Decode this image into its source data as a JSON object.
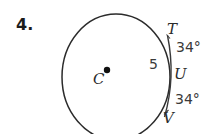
{
  "problem": {
    "number": "4."
  },
  "figure": {
    "type": "circle-with-secant-and-tangent-arc",
    "center_label": "C",
    "points": [
      {
        "id": "T",
        "label": "T"
      },
      {
        "id": "U",
        "label": "U"
      },
      {
        "id": "V",
        "label": "V"
      }
    ],
    "measures": [
      {
        "id": "angle-top",
        "label": "34°"
      },
      {
        "id": "angle-bottom",
        "label": "34°"
      },
      {
        "id": "segment-length",
        "label": "5"
      }
    ],
    "colors": {
      "stroke": "#2b2b2b",
      "text": "#2b2b2b",
      "background": "#ffffff",
      "center_dot": "#111111"
    }
  }
}
